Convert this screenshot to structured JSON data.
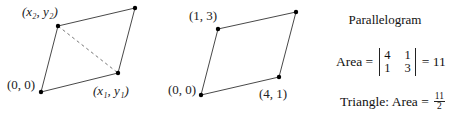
{
  "left_diagram": {
    "vertices": {
      "origin": {
        "label": "(0, 0)"
      },
      "p1": {
        "label": "(x₁, y₁)"
      },
      "p2": {
        "label": "(x₂, y₂)"
      },
      "sum": {
        "label": ""
      }
    },
    "diagonal": "dashed from (x₂, y₂) to (x₁, y₁)"
  },
  "right_diagram": {
    "vertices": {
      "origin": {
        "label": "(0, 0)"
      },
      "p1": {
        "label": "(4, 1)"
      },
      "p2": {
        "label": "(1, 3)"
      },
      "sum": {
        "label": ""
      }
    }
  },
  "panel": {
    "title": "Parallelogram",
    "area_label": "Area =",
    "matrix": [
      [
        "4",
        "1"
      ],
      [
        "1",
        "3"
      ]
    ],
    "area_result": "= 11",
    "triangle_label": "Triangle: Area =",
    "triangle_numerator": "11",
    "triangle_denominator": "2"
  }
}
